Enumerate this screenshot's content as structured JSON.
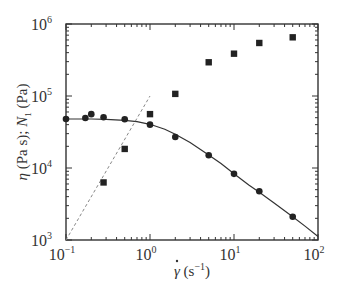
{
  "chart_data": {
    "type": "scatter",
    "title": "",
    "xlabel": "γ̇ (s⁻¹)",
    "ylabel": "η (Pa s); N₁ (Pa)",
    "xscale": "log",
    "yscale": "log",
    "xlim": [
      0.1,
      100
    ],
    "ylim": [
      1000,
      1000000
    ],
    "x_ticks": [
      {
        "value": 0.1,
        "base": "10",
        "exp": "−1"
      },
      {
        "value": 1,
        "base": "10",
        "exp": "0"
      },
      {
        "value": 10,
        "base": "10",
        "exp": "1"
      },
      {
        "value": 100,
        "base": "10",
        "exp": "2"
      }
    ],
    "y_ticks": [
      {
        "value": 1000,
        "base": "10",
        "exp": "3"
      },
      {
        "value": 10000,
        "base": "10",
        "exp": "4"
      },
      {
        "value": 100000,
        "base": "10",
        "exp": "5"
      },
      {
        "value": 1000000,
        "base": "10",
        "exp": "6"
      }
    ],
    "grid": false,
    "legend": null,
    "series": [
      {
        "name": "η (viscosity)",
        "marker": "circle",
        "color": "#222222",
        "x": [
          0.1,
          0.17,
          0.2,
          0.28,
          0.5,
          1.0,
          2.0,
          5.0,
          10,
          20,
          50
        ],
        "y": [
          48000,
          49500,
          56000,
          50600,
          47500,
          40000,
          27000,
          15000,
          8300,
          4750,
          2100
        ]
      },
      {
        "name": "N₁ (first normal stress difference)",
        "marker": "square",
        "color": "#222222",
        "x": [
          0.28,
          0.5,
          1.0,
          2.0,
          5.0,
          10,
          20,
          50
        ],
        "y": [
          6300,
          18400,
          56000,
          107000,
          294000,
          387000,
          545000,
          653000
        ]
      },
      {
        "name": "η model fit",
        "style": "solid-line",
        "color": "#333333",
        "x": [
          0.1,
          0.15,
          0.2,
          0.3,
          0.5,
          0.7,
          1.0,
          1.5,
          2.0,
          3.0,
          5.0,
          7.0,
          10,
          15,
          20,
          30,
          50,
          70,
          100
        ],
        "y": [
          48000,
          48000,
          47900,
          47500,
          46000,
          44000,
          40500,
          34500,
          29500,
          22500,
          15200,
          11500,
          8300,
          5800,
          4600,
          3250,
          2100,
          1560,
          1120
        ]
      },
      {
        "name": "N₁ slope-2 reference",
        "style": "dashed-line",
        "color": "#888888",
        "x": [
          0.1,
          1.0
        ],
        "y": [
          1000,
          100000
        ]
      }
    ]
  },
  "layout": {
    "plot_left": 66,
    "plot_right": 318,
    "plot_top": 24,
    "plot_bottom": 240
  }
}
